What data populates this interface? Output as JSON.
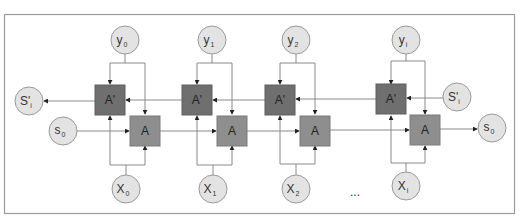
{
  "diagram": {
    "type": "bidirectional-rnn",
    "colors": {
      "frame": "#9a9a9a",
      "node_fill": "#e3e3e3",
      "node_stroke": "#9a9a9a",
      "backward_cell": "#6f6f6f",
      "forward_cell": "#8e8e8e",
      "edge": "#8a8a8a",
      "arrowhead": "#222222"
    },
    "outputs": [
      {
        "base": "y",
        "sub": "0"
      },
      {
        "base": "y",
        "sub": "1"
      },
      {
        "base": "y",
        "sub": "2"
      },
      {
        "base": "y",
        "sub": "i"
      }
    ],
    "inputs": [
      {
        "base": "X",
        "sub": "0"
      },
      {
        "base": "X",
        "sub": "1"
      },
      {
        "base": "X",
        "sub": "2"
      },
      {
        "base": "X",
        "sub": "i"
      }
    ],
    "backward_cells": [
      "A'",
      "A'",
      "A'",
      "A'"
    ],
    "forward_cells": [
      "A",
      "A",
      "A",
      "A"
    ],
    "states": {
      "backward_out": {
        "base": "S'",
        "sub": "i"
      },
      "backward_in": {
        "base": "S'",
        "sub": "i"
      },
      "forward_in": {
        "base": "s",
        "sub": "0"
      },
      "forward_out": {
        "base": "s",
        "sub": "0"
      }
    },
    "ellipsis": "..."
  }
}
